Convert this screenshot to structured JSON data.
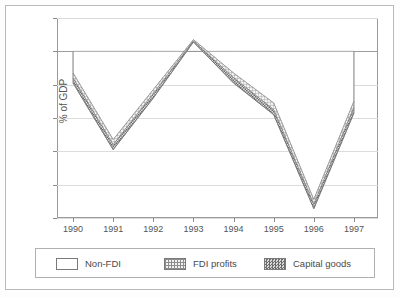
{
  "figure": {
    "ylabel": "% of GDP",
    "yticks": [
      "1",
      "0",
      "-1",
      "-2",
      "-3",
      "-4",
      "-5"
    ],
    "xticks": [
      "1990",
      "1991",
      "1992",
      "1993",
      "1994",
      "1995",
      "1996",
      "1997"
    ]
  },
  "legend": {
    "items": [
      {
        "label": "Non-FDI",
        "swatch": "white-empty",
        "color": "#ffffff"
      },
      {
        "label": "FDI profits",
        "swatch": "grid-hatch",
        "color": "#8d8d8d"
      },
      {
        "label": "Capital goods",
        "swatch": "dense-checker",
        "color": "#6e6e6e"
      }
    ]
  },
  "chart_data": {
    "type": "area",
    "title": "",
    "xlabel": "",
    "ylabel": "% of GDP",
    "categories": [
      "1990",
      "1991",
      "1992",
      "1993",
      "1994",
      "1995",
      "1996",
      "1997"
    ],
    "x": [
      1990,
      1991,
      1992,
      1993,
      1994,
      1995,
      1996,
      1997
    ],
    "xlim": [
      1989.6,
      1997.6
    ],
    "ylim": [
      -5,
      1
    ],
    "ytick_values": [
      1,
      0,
      -1,
      -2,
      -3,
      -4,
      -5
    ],
    "grid": true,
    "stacked": true,
    "legend_position": "below-plot",
    "series": [
      {
        "name": "Non-FDI",
        "values": [
          -0.65,
          -2.65,
          -1.15,
          0.35,
          -0.65,
          -1.55,
          -4.45,
          -1.5
        ]
      },
      {
        "name": "FDI profits",
        "values": [
          -0.15,
          -0.15,
          -0.12,
          -0.04,
          -0.14,
          -0.2,
          -0.14,
          -0.18
        ]
      },
      {
        "name": "Capital goods",
        "values": [
          -0.15,
          -0.15,
          -0.13,
          -0.03,
          -0.16,
          -0.15,
          -0.13,
          -0.17
        ]
      }
    ],
    "cumulative_totals": [
      -0.95,
      -2.95,
      -1.4,
      0.28,
      -0.95,
      -1.9,
      -4.72,
      -1.85
    ],
    "band_upper": [
      -0.65,
      -2.65,
      -1.15,
      0.35,
      -0.65,
      -1.55,
      -4.45,
      -1.5
    ]
  }
}
